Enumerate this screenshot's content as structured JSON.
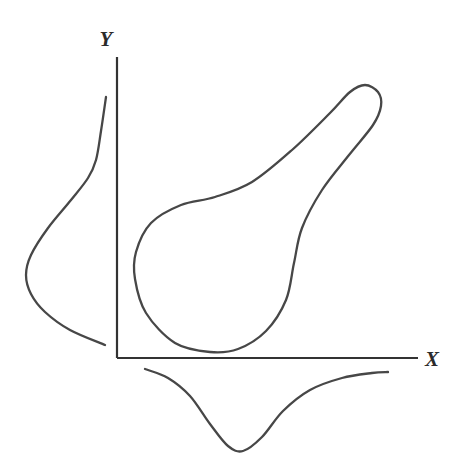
{
  "figure": {
    "title": "",
    "background_color": "#ffffff",
    "stroke_color": "#474747",
    "axis_color": "#333333",
    "axis_label_x": "X",
    "axis_label_y": "Y",
    "width": 462,
    "height": 468
  },
  "chart_data": {
    "type": "line",
    "title": "",
    "xlabel": "X",
    "ylabel": "Y",
    "grid": false,
    "legend": "none",
    "axes": {
      "origin_px": [
        117,
        358
      ],
      "y_axis_top_px": [
        117,
        57
      ],
      "x_axis_right_px": [
        418,
        358
      ],
      "xlim": [
        0,
        1
      ],
      "ylim": [
        0,
        1
      ]
    },
    "series": [
      {
        "name": "joint-support-contour",
        "kind": "closed-contour",
        "closed": true,
        "points_px": [
          [
            210,
            352
          ],
          [
            175,
            343
          ],
          [
            146,
            313
          ],
          [
            135,
            279
          ],
          [
            136,
            252
          ],
          [
            151,
            223
          ],
          [
            181,
            205
          ],
          [
            215,
            197
          ],
          [
            252,
            182
          ],
          [
            292,
            150
          ],
          [
            330,
            113
          ],
          [
            350,
            92
          ],
          [
            365,
            85
          ],
          [
            378,
            92
          ],
          [
            381,
            106
          ],
          [
            373,
            125
          ],
          [
            349,
            155
          ],
          [
            322,
            190
          ],
          [
            302,
            228
          ],
          [
            294,
            263
          ],
          [
            286,
            300
          ],
          [
            266,
            331
          ],
          [
            238,
            349
          ],
          [
            210,
            352
          ]
        ]
      },
      {
        "name": "marginal-density-y",
        "kind": "open-curve",
        "orientation": "vertical-left-of-y-axis",
        "points_px": [
          [
            106,
            97
          ],
          [
            101,
            131
          ],
          [
            96,
            160
          ],
          [
            88,
            178
          ],
          [
            71,
            200
          ],
          [
            48,
            228
          ],
          [
            31,
            255
          ],
          [
            26,
            275
          ],
          [
            31,
            294
          ],
          [
            45,
            312
          ],
          [
            70,
            330
          ],
          [
            105,
            345
          ]
        ]
      },
      {
        "name": "marginal-density-x",
        "kind": "open-curve",
        "orientation": "horizontal-below-x-axis",
        "points_px": [
          [
            145,
            369
          ],
          [
            168,
            378
          ],
          [
            190,
            396
          ],
          [
            210,
            424
          ],
          [
            228,
            446
          ],
          [
            243,
            451
          ],
          [
            262,
            437
          ],
          [
            283,
            411
          ],
          [
            310,
            390
          ],
          [
            342,
            378
          ],
          [
            372,
            373
          ],
          [
            388,
            372
          ]
        ]
      }
    ]
  }
}
